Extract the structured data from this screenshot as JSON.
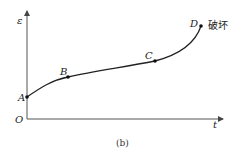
{
  "figure": {
    "caption": "(b)",
    "axes": {
      "y_label": "ε",
      "x_label": "t",
      "origin_label": "O"
    },
    "points": [
      {
        "label": "A",
        "x": 27,
        "y": 97
      },
      {
        "label": "B",
        "x": 68,
        "y": 77
      },
      {
        "label": "C",
        "x": 155,
        "y": 61
      },
      {
        "label": "D",
        "x": 201,
        "y": 26
      }
    ],
    "annotation": "破坏",
    "colors": {
      "line": "#222222",
      "axis": "#555555"
    }
  }
}
